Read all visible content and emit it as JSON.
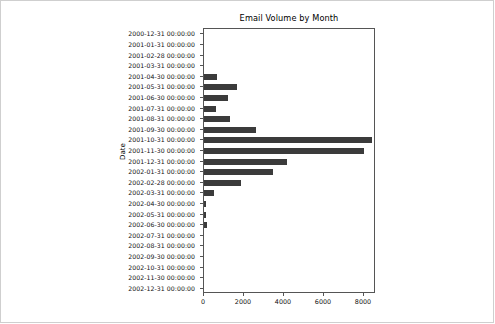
{
  "chart_data": {
    "type": "bar",
    "orientation": "horizontal",
    "title": "Email Volume by Month",
    "xlabel": "",
    "ylabel": "Date",
    "grid": false,
    "legend": null,
    "bar_color": "#3b3b3b",
    "xlim": [
      0,
      8600
    ],
    "xticks": [
      0,
      2000,
      4000,
      6000,
      8000
    ],
    "xtick_labels": [
      "0",
      "2000",
      "4000",
      "6000",
      "8000"
    ],
    "categories": [
      "2000-12-31 00:00:00",
      "2001-01-31 00:00:00",
      "2001-02-28 00:00:00",
      "2001-03-31 00:00:00",
      "2001-04-30 00:00:00",
      "2001-05-31 00:00:00",
      "2001-06-30 00:00:00",
      "2001-07-31 00:00:00",
      "2001-08-31 00:00:00",
      "2001-09-30 00:00:00",
      "2001-10-31 00:00:00",
      "2001-11-30 00:00:00",
      "2001-12-31 00:00:00",
      "2002-01-31 00:00:00",
      "2002-02-28 00:00:00",
      "2002-03-31 00:00:00",
      "2002-04-30 00:00:00",
      "2002-05-31 00:00:00",
      "2002-06-30 00:00:00",
      "2002-07-31 00:00:00",
      "2002-08-31 00:00:00",
      "2002-09-30 00:00:00",
      "2002-10-31 00:00:00",
      "2002-11-30 00:00:00",
      "2002-12-31 00:00:00"
    ],
    "values": [
      0,
      0,
      0,
      0,
      650,
      1650,
      1200,
      600,
      1300,
      2600,
      8400,
      8000,
      4150,
      3450,
      1850,
      480,
      90,
      90,
      150,
      0,
      0,
      0,
      0,
      0,
      0
    ]
  }
}
